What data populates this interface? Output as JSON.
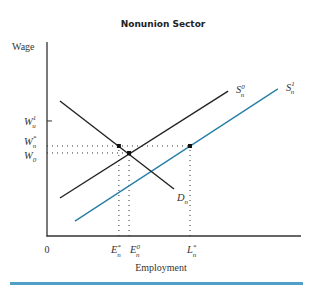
{
  "chart_data": {
    "type": "line",
    "title": "Nonunion Sector",
    "xlabel": "Employment",
    "ylabel": "Wage",
    "xlim": [
      0,
      100
    ],
    "ylim": [
      0,
      100
    ],
    "origin_label": "0",
    "grid": false,
    "legend": "none",
    "series": [
      {
        "name": "S_n^0",
        "label": {
          "base": "S",
          "sub": "n",
          "sup": "0"
        },
        "color": "#222222",
        "points": [
          [
            5.1,
            19.6
          ],
          [
            71.3,
            74.7
          ]
        ]
      },
      {
        "name": "S_n^1",
        "label": {
          "base": "S",
          "sub": "n",
          "sup": "1"
        },
        "color": "#2a7fa6",
        "points": [
          [
            11.0,
            7.7
          ],
          [
            90.9,
            75.8
          ]
        ]
      },
      {
        "name": "D_n",
        "label": {
          "base": "D",
          "sub": "n",
          "sup": ""
        },
        "color": "#222222",
        "points": [
          [
            5.1,
            69.6
          ],
          [
            50.0,
            24.2
          ]
        ]
      }
    ],
    "y_ticks": [
      {
        "id": "wu1",
        "value": 59.3,
        "label": {
          "base": "W",
          "sub": "u",
          "sup": "1"
        },
        "tick_mark": true
      },
      {
        "id": "wn",
        "value": 46.4,
        "label": {
          "base": "W",
          "sub": "n",
          "sup": "*"
        },
        "tick_mark": false
      },
      {
        "id": "w0",
        "value": 42.8,
        "label": {
          "base": "W",
          "sub": "0",
          "sup": ""
        },
        "tick_mark": false
      }
    ],
    "x_ticks": [
      {
        "id": "en_star",
        "value": 28.3,
        "label": {
          "base": "E",
          "sub": "n",
          "sup": "*"
        }
      },
      {
        "id": "en0",
        "value": 32.3,
        "label": {
          "base": "E",
          "sub": "n",
          "sup": "0"
        }
      },
      {
        "id": "ln_star",
        "value": 56.3,
        "label": {
          "base": "L",
          "sub": "n",
          "sup": "*"
        }
      }
    ],
    "points": [
      {
        "name": "demand-at-wn",
        "x": 28.3,
        "y": 46.4
      },
      {
        "name": "equilibrium-s0-d",
        "x": 32.3,
        "y": 42.8
      },
      {
        "name": "supply-s1-at-wn",
        "x": 56.3,
        "y": 46.4
      }
    ],
    "dotted_guides": [
      {
        "name": "wn-horizontal",
        "from": [
          0,
          46.4
        ],
        "to": [
          56.3,
          46.4
        ]
      },
      {
        "name": "w0-horizontal",
        "from": [
          0,
          42.8
        ],
        "to": [
          32.3,
          42.8
        ]
      },
      {
        "name": "en-star-vertical",
        "from": [
          28.3,
          0
        ],
        "to": [
          28.3,
          46.4
        ]
      },
      {
        "name": "en0-vertical",
        "from": [
          32.3,
          0
        ],
        "to": [
          32.3,
          42.8
        ]
      },
      {
        "name": "ln-star-vertical",
        "from": [
          56.3,
          0
        ],
        "to": [
          56.3,
          46.4
        ]
      }
    ]
  },
  "accent_color": "#2a7fa6"
}
